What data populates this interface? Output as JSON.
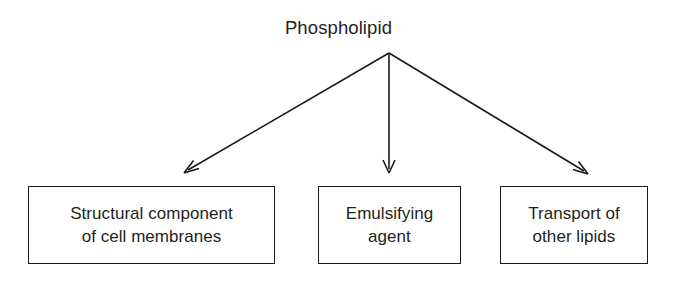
{
  "diagram": {
    "type": "tree-branching-diagram",
    "background_color": "#ffffff",
    "stroke_color": "#1a1a1a",
    "text_color": "#231f20",
    "root": {
      "label": "Phospholipid"
    },
    "branches": [
      {
        "arrow_name": "arrow-to-structural-component",
        "lines": [
          "Structural component",
          "of cell membranes"
        ],
        "line1": "Structural component",
        "line2": "of cell membranes"
      },
      {
        "arrow_name": "arrow-to-emulsifying-agent",
        "lines": [
          "Emulsifying",
          "agent"
        ],
        "line1": "Emulsifying",
        "line2": "agent"
      },
      {
        "arrow_name": "arrow-to-transport-of-other-lipids",
        "lines": [
          "Transport of",
          "other lipids"
        ],
        "line1": "Transport of",
        "line2": "other lipids"
      }
    ]
  }
}
